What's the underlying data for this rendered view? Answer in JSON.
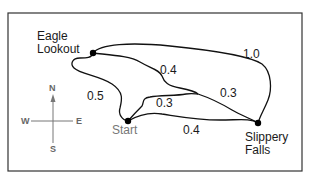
{
  "map": {
    "type": "trail-map",
    "colors": {
      "trail": "#111111",
      "frame": "#333333",
      "compass": "#777777",
      "start_label": "#777777"
    },
    "places": {
      "eagle_lookout": {
        "line1": "Eagle",
        "line2": "Lookout"
      },
      "start": {
        "label": "Start"
      },
      "slippery_falls": {
        "line1": "Slippery",
        "line2": "Falls"
      }
    },
    "trails": [
      {
        "id": "eagle-to-falls-north",
        "from": "Eagle Lookout",
        "to": "Slippery Falls",
        "distance": "1.0"
      },
      {
        "id": "eagle-to-junction",
        "from": "Eagle Lookout",
        "to": "Junction",
        "distance": "0.4"
      },
      {
        "id": "eagle-to-start",
        "from": "Eagle Lookout",
        "to": "Start",
        "distance": "0.5"
      },
      {
        "id": "start-to-junction",
        "from": "Start",
        "to": "Junction",
        "distance": "0.3"
      },
      {
        "id": "junction-to-falls",
        "from": "Junction",
        "to": "Slippery Falls",
        "distance": "0.3"
      },
      {
        "id": "start-to-falls",
        "from": "Start",
        "to": "Slippery Falls",
        "distance": "0.4"
      }
    ],
    "compass": {
      "n": "N",
      "s": "S",
      "e": "E",
      "w": "W",
      "icon": "compass-rose-icon"
    }
  }
}
